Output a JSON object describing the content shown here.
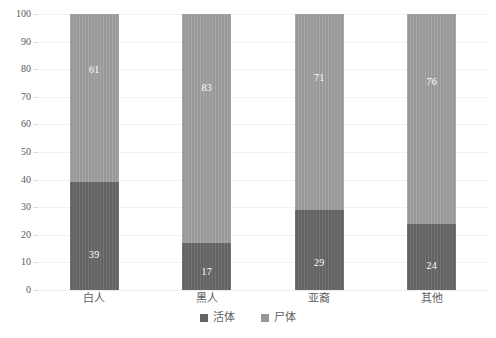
{
  "chart_data": {
    "type": "bar",
    "stacked": true,
    "title": "",
    "subtitle": "",
    "xlabel": "",
    "ylabel": "",
    "ylim": [
      0,
      100
    ],
    "ytick_labels": [
      "0",
      "10",
      "20",
      "30",
      "40",
      "50",
      "60",
      "70",
      "80",
      "90",
      "100"
    ],
    "ytick_values": [
      0,
      10,
      20,
      30,
      40,
      50,
      60,
      70,
      80,
      90,
      100
    ],
    "grid": true,
    "grid_axis": "y",
    "legend_position": "bottom",
    "categories": [
      "白人",
      "黑人",
      "亚裔",
      "其他"
    ],
    "series": [
      {
        "name": "活体",
        "color": "#636363",
        "values": [
          39,
          17,
          29,
          24
        ]
      },
      {
        "name": "尸体",
        "color": "#989898",
        "values": [
          61,
          83,
          71,
          76
        ]
      }
    ]
  },
  "legend": {
    "items": [
      {
        "label": "活体",
        "swatch": "legend-swatch-live"
      },
      {
        "label": "尸体",
        "swatch": "legend-swatch-dead"
      }
    ]
  },
  "colors": {
    "series_live": "#636363",
    "series_dead": "#989898",
    "gridline": "#f2f2f2",
    "tick_text": "#595959",
    "category_text": "#5e5e5e",
    "data_label_text": "#ffffff",
    "background": "#ffffff"
  }
}
